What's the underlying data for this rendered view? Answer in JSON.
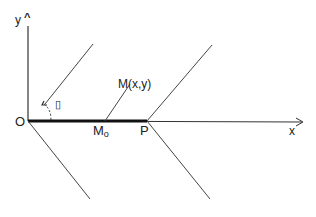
{
  "diagram": {
    "labels": {
      "y_axis": "y",
      "x_axis": "x",
      "origin": "O",
      "point_m": "M(x,y)",
      "point_m0": "M",
      "point_m0_sub": "o",
      "point_p": "P",
      "angle_symbol": "▯"
    },
    "colors": {
      "line": "#333333",
      "text": "#222222",
      "background": "#ffffff"
    }
  }
}
